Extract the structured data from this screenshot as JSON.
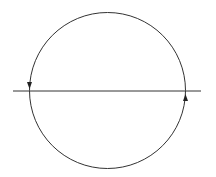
{
  "diagram": {
    "stroke_color": "#333333",
    "background": "#ffffff",
    "circle": {
      "cx": 107.5,
      "cy": 90.5,
      "r": 78
    },
    "line": {
      "x1": 13,
      "y1": 91,
      "x2": 201,
      "y2": 91
    },
    "arrows": [
      {
        "name": "left-arrow",
        "direction": "down",
        "x": 29.5,
        "y": 86
      },
      {
        "name": "right-arrow",
        "direction": "up",
        "x": 185.5,
        "y": 97
      }
    ]
  }
}
